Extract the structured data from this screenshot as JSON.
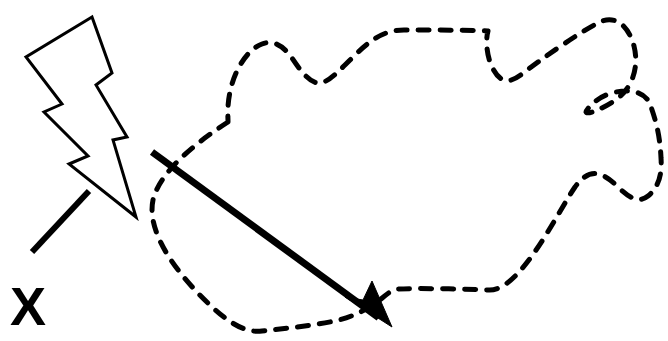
{
  "figure": {
    "background_color": "#ffffff",
    "stroke_color": "#000000",
    "width": 668,
    "height": 341
  },
  "annotations": {
    "marker_label": "X",
    "marker_label_position": {
      "x": 10,
      "y": 325
    },
    "leader_line": {
      "name": "leader-line",
      "from": {
        "x": 32,
        "y": 252
      },
      "to": {
        "x": 89,
        "y": 191
      },
      "stroke_width": 6
    }
  },
  "shapes": {
    "region_outline": {
      "name": "dashed-region-outline",
      "style": "dashed",
      "dash_pattern": "11 11",
      "stroke_width": 5,
      "closed": true,
      "path": "M 228 122 C 200 140 160 170 153 200 C 146 233 178 275 210 305 C 232 326 248 333 262 331 C 300 327 320 324 335 321 C 357 316 372 306 381 299 C 388 293 392 290 398 289 C 420 288 462 289 489 290 C 520 291 556 215 575 187 C 588 169 600 170 616 185 C 628 197 638 204 648 196 C 660 186 662 172 661 158 C 660 134 655 118 650 104 C 645 92 630 88 612 93 C 596 97 586 110 586 112 C 587 115 600 110 614 101 C 630 91 640 70 634 46 C 628 24 614 15 600 22 C 578 33 540 60 522 74 C 508 85 498 83 490 62 C 486 50 486 38 488 31 C 470 30 430 30 404 30 C 382 30 368 42 350 60 C 336 74 328 82 320 83 C 310 84 300 70 292 58 C 282 44 272 40 262 44 C 246 50 234 72 230 92 C 227 106 228 116 228 122 Z"
    },
    "lightning_bolt": {
      "name": "lightning-bolt",
      "style": "outline",
      "fill": "#ffffff",
      "stroke_width": 3,
      "path": "M 92 17 L 26 57 L 62 104 L 44 112 L 88 156 L 69 164 L 136 217 L 113 140 L 127 137 L 96 85 L 112 73 Z"
    },
    "arrow": {
      "name": "bold-arrow",
      "style": "solid",
      "stroke_width": 7,
      "from": {
        "x": 152,
        "y": 152
      },
      "to": {
        "x": 390,
        "y": 326
      },
      "arrowhead": "filled-triangle",
      "arrowhead_path": "M 392 327 L 345 297 L 363 300 L 372 281 Z"
    }
  }
}
